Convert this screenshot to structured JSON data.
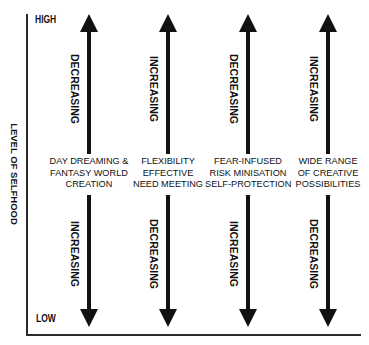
{
  "diagram": {
    "y_axis": {
      "title": "LEVEL OF SELFHOOD",
      "high_label": "HIGH",
      "low_label": "LOW"
    },
    "columns": [
      {
        "label_lines": [
          "DAY DREAMING &",
          "FANTASY WORLD",
          "CREATION"
        ],
        "upper_text": "DECREASING",
        "lower_text": "INCREASING"
      },
      {
        "label_lines": [
          "FLEXIBILITY",
          "EFFECTIVE",
          "NEED MEETING"
        ],
        "upper_text": "INCREASING",
        "lower_text": "DECREASING"
      },
      {
        "label_lines": [
          "FEAR-INFUSED",
          "RISK MINISATION",
          "SELF-PROTECTION"
        ],
        "upper_text": "DECREASING",
        "lower_text": "INCREASING"
      },
      {
        "label_lines": [
          "WIDE RANGE",
          "OF CREATIVE",
          "POSSIBILITIES"
        ],
        "upper_text": "INCREASING",
        "lower_text": "DECREASING"
      }
    ],
    "colors": {
      "ink": "#111111",
      "background": "#ffffff"
    }
  }
}
